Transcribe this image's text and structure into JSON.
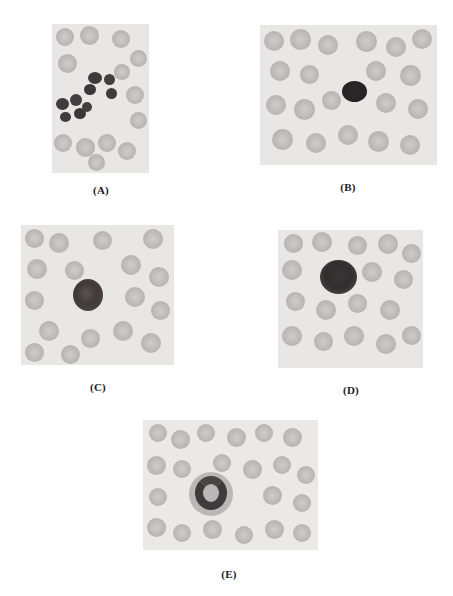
{
  "figure": {
    "panels": [
      {
        "id": "A",
        "label": "(A)",
        "description": "blood smear, multilobed nucleated cell among red cells"
      },
      {
        "id": "B",
        "label": "(B)",
        "description": "blood smear, small round dark-nucleus cell among red cells"
      },
      {
        "id": "C",
        "label": "(C)",
        "description": "blood smear, granular round cell among red cells"
      },
      {
        "id": "D",
        "label": "(D)",
        "description": "blood smear, large granular cell among red cells"
      },
      {
        "id": "E",
        "label": "(E)",
        "description": "blood smear, horseshoe-nucleus cell among red cells"
      }
    ]
  },
  "colors": {
    "background": "#ffffff",
    "smear": "#e9e7e6",
    "red_cell": "#bdb9b8",
    "nucleus": "#3a3536",
    "label": "#1c1c1c"
  }
}
